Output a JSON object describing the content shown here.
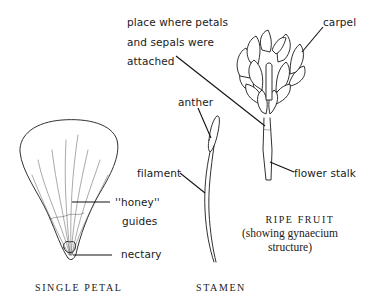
{
  "figure": {
    "panels": [
      {
        "id": "single-petal",
        "caption": "SINGLE PETAL",
        "labels": {
          "honey_guides_line1": "''honey''",
          "honey_guides_line2": "guides",
          "nectary": "nectary"
        }
      },
      {
        "id": "stamen",
        "caption": "STAMEN",
        "labels": {
          "anther": "anther",
          "filament": "filament"
        }
      },
      {
        "id": "ripe-fruit",
        "caption": "RIPE FRUIT",
        "subcaption_line1": "(showing gynaecium",
        "subcaption_line2": "structure)",
        "labels": {
          "attachment_line1": "place where petals",
          "attachment_line2": "and sepals were",
          "attachment_line3": "attached",
          "carpel": "carpel",
          "flower_stalk": "flower stalk"
        }
      }
    ],
    "colors": {
      "ink": "#1a1a1a",
      "background": "#ffffff"
    }
  }
}
